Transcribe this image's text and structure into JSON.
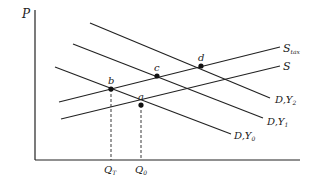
{
  "diagram": {
    "type": "supply-demand",
    "axes": {
      "y_label": "P",
      "x_label": ""
    },
    "curves": [
      {
        "id": "S_tax",
        "label": "S",
        "label_sub": "tax",
        "kind": "supply"
      },
      {
        "id": "S",
        "label": "S",
        "label_sub": "",
        "kind": "supply"
      },
      {
        "id": "DY2",
        "label": "D,Y",
        "label_sub": "2",
        "kind": "demand"
      },
      {
        "id": "DY1",
        "label": "D,Y",
        "label_sub": "1",
        "kind": "demand"
      },
      {
        "id": "DY0",
        "label": "D,Y",
        "label_sub": "0",
        "kind": "demand"
      }
    ],
    "points": [
      {
        "id": "a",
        "label": "a"
      },
      {
        "id": "b",
        "label": "b"
      },
      {
        "id": "c",
        "label": "c"
      },
      {
        "id": "d",
        "label": "d"
      }
    ],
    "quantity_marks": [
      {
        "id": "QT",
        "label": "Q",
        "label_sub": "T"
      },
      {
        "id": "Q0",
        "label": "Q",
        "label_sub": "0"
      }
    ],
    "colors": {
      "line": "#222222",
      "background": "#ffffff"
    }
  }
}
